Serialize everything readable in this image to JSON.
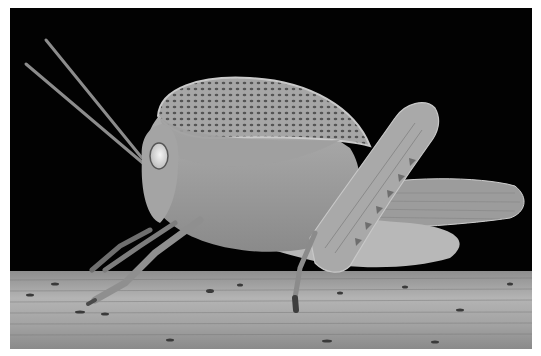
{
  "photo": {
    "subject": "grasshopper",
    "background": "black",
    "surface": "wooden stem",
    "tone": "grayscale",
    "colors": {
      "background": "#020202",
      "body": "#9a9a9a",
      "pronotum": "#a8a8a8",
      "wood": "#a6a6a6",
      "eye": "#e0e0e0",
      "frame": "#ffffff"
    }
  }
}
